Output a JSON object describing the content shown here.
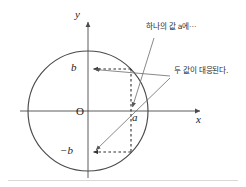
{
  "figure": {
    "type": "math-diagram",
    "background_color": "#ffffff",
    "line_color": "#4a4a4a",
    "text_color": "#1a1a1a",
    "border_color": "#cfcfcf"
  },
  "axes": {
    "x_label": "x",
    "y_label": "y",
    "origin_label": "O",
    "origin_px": {
      "x": 88,
      "y": 111
    },
    "x_axis_from_px": 20,
    "x_axis_to_px": 205,
    "y_axis_from_px": 18,
    "y_axis_to_px": 178
  },
  "circle": {
    "center_px": {
      "x": 88,
      "y": 111
    },
    "radius_px": 60,
    "stroke": "#4a4a4a",
    "stroke_width": 1.1
  },
  "tick_labels": {
    "b": "b",
    "minus_b": "−b",
    "a": "a"
  },
  "points": {
    "upper_intersection_px": {
      "x": 131,
      "y": 69
    },
    "lower_intersection_px": {
      "x": 131,
      "y": 152
    },
    "a_on_x_axis_px": {
      "x": 131,
      "y": 111
    },
    "b_on_y_axis_px": {
      "x": 88,
      "y": 69
    },
    "minus_b_on_y_axis_px": {
      "x": 88,
      "y": 152
    }
  },
  "annotations": [
    {
      "id": "annotation-one-value-a",
      "text": "하나의 값 a에⋯",
      "x_px": 146,
      "y_px": 27,
      "leader_to_px": {
        "x": 131,
        "y": 111
      }
    },
    {
      "id": "annotation-two-values",
      "text": "두 값이 대응된다.",
      "x_px": 172,
      "y_px": 71,
      "leader_to_upper_px": {
        "x": 89,
        "y": 69
      },
      "leader_to_lower_px": {
        "x": 91,
        "y": 152
      }
    }
  ],
  "dashed_segments": [
    {
      "id": "dash-b-horizontal",
      "from_px": {
        "x": 88,
        "y": 69
      },
      "to_px": {
        "x": 131,
        "y": 69
      }
    },
    {
      "id": "dash-minus-b-horizontal",
      "from_px": {
        "x": 88,
        "y": 152
      },
      "to_px": {
        "x": 131,
        "y": 152
      }
    },
    {
      "id": "dash-a-vertical",
      "from_px": {
        "x": 131,
        "y": 69
      },
      "to_px": {
        "x": 131,
        "y": 152
      }
    }
  ]
}
